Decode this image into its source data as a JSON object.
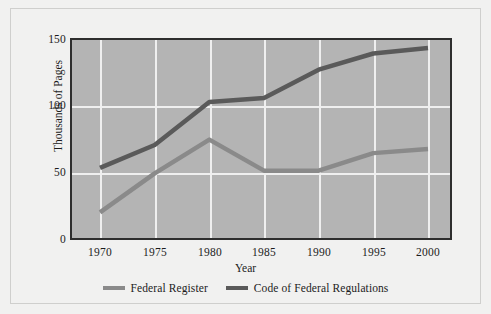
{
  "chart_data": {
    "type": "line",
    "title": "",
    "xlabel": "Year",
    "ylabel": "Thousands of Pages",
    "x": [
      1970,
      1975,
      1980,
      1985,
      1990,
      1995,
      2000
    ],
    "xticklabels": [
      "1970",
      "1975",
      "1980",
      "1985",
      "1990",
      "1995",
      "2000"
    ],
    "yticklabels": [
      "0",
      "50",
      "100",
      "150"
    ],
    "yticks": [
      0,
      50,
      100,
      150
    ],
    "xlim": [
      1970,
      2000
    ],
    "ylim": [
      0,
      150
    ],
    "grid": true,
    "legend_position": "below",
    "plot_background": "#b4b4b4",
    "gridline_color": "#efefef",
    "figure_background": "#f1f1f0",
    "series": [
      {
        "name": "Federal Register",
        "color": "#8a8a8a",
        "values": [
          22,
          51,
          76,
          53,
          53,
          66,
          69
        ]
      },
      {
        "name": "Code of Federal Regulations",
        "color": "#5a5a5a",
        "values": [
          55,
          72,
          104,
          107,
          128,
          140,
          144
        ]
      }
    ]
  },
  "axis": {
    "ylabel": "Thousands of Pages",
    "xlabel": "Year",
    "yticks": [
      {
        "label": "150",
        "value": 150
      },
      {
        "label": "100",
        "value": 100
      },
      {
        "label": "50",
        "value": 50
      },
      {
        "label": "0",
        "value": 0
      }
    ],
    "xticks": [
      {
        "label": "1970",
        "value": 1970
      },
      {
        "label": "1975",
        "value": 1975
      },
      {
        "label": "1980",
        "value": 1980
      },
      {
        "label": "1985",
        "value": 1985
      },
      {
        "label": "1990",
        "value": 1990
      },
      {
        "label": "1995",
        "value": 1995
      },
      {
        "label": "2000",
        "value": 2000
      }
    ]
  },
  "legend": {
    "entries": [
      {
        "label": "Federal Register",
        "color": "#8a8a8a"
      },
      {
        "label": "Code of Federal Regulations",
        "color": "#5a5a5a"
      }
    ]
  }
}
